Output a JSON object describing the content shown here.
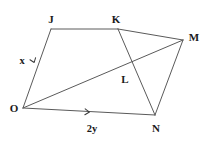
{
  "figure": {
    "background_color": "#ffffff",
    "stroke_color": "#5a5a5a",
    "label_color": "#1a1a1a",
    "width": 214,
    "height": 141,
    "vertices": [
      {
        "id": "J",
        "label": "J",
        "x": 51,
        "y": 29,
        "label_x": 51,
        "label_y": 19
      },
      {
        "id": "K",
        "label": "K",
        "x": 118,
        "y": 29,
        "label_x": 116,
        "label_y": 19
      },
      {
        "id": "M",
        "label": "M",
        "x": 183,
        "y": 40,
        "label_x": 194,
        "label_y": 37
      },
      {
        "id": "L",
        "label": "L",
        "x": 128,
        "y": 72,
        "label_x": 125,
        "label_y": 79
      },
      {
        "id": "O",
        "label": "O",
        "x": 23,
        "y": 108,
        "label_x": 14,
        "label_y": 108
      },
      {
        "id": "N",
        "label": "N",
        "x": 155,
        "y": 115,
        "label_x": 156,
        "label_y": 128
      }
    ],
    "segments": [
      {
        "id": "JO",
        "from": "J",
        "to": "O",
        "name": "side-j-o"
      },
      {
        "id": "JK",
        "from": "J",
        "to": "K",
        "name": "side-j-k"
      },
      {
        "id": "KM",
        "from": "K",
        "to": "M",
        "name": "side-k-m"
      },
      {
        "id": "MN",
        "from": "M",
        "to": "N",
        "name": "side-m-n"
      },
      {
        "id": "ON",
        "from": "O",
        "to": "N",
        "name": "side-o-n"
      },
      {
        "id": "OM",
        "from": "O",
        "to": "M",
        "name": "diagonal-o-m"
      },
      {
        "id": "KN",
        "from": "K",
        "to": "N",
        "name": "segment-k-n"
      }
    ],
    "measures": [
      {
        "id": "x",
        "label": "x",
        "on_segment": "JO",
        "label_x": 22,
        "label_y": 61
      },
      {
        "id": "2y",
        "label": "2y",
        "on_segment": "ON",
        "label_x": 92,
        "label_y": 129
      }
    ],
    "tick_marks": [
      {
        "id": "tick-jo",
        "name": "single-arrow-tick-side-jo",
        "x": 34,
        "y": 62,
        "angle": 70
      },
      {
        "id": "tick-on",
        "name": "single-arrow-tick-side-on",
        "x": 89,
        "y": 112,
        "angle": 3
      }
    ]
  }
}
